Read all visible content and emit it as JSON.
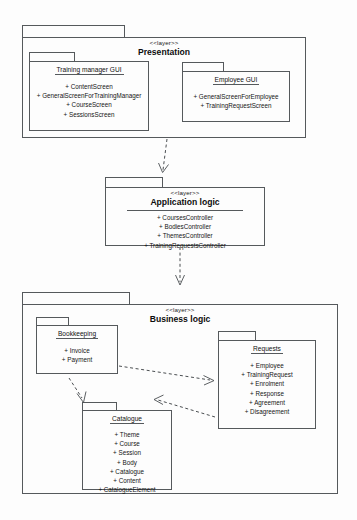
{
  "diagram": {
    "type": "uml-package-diagram",
    "stereotype": "<<layer>>",
    "visibility_marker": "+"
  },
  "layers": [
    {
      "id": "presentation",
      "stereotype": "<<layer>>",
      "name": "Presentation",
      "packages": [
        {
          "id": "training-manager-gui",
          "name": "Training manager GUI",
          "members": [
            "+ ContentScreen",
            "+ GeneralScreenForTrainingManager",
            "+ CourseScreen",
            "+ SessionsScreen"
          ]
        },
        {
          "id": "employee-gui",
          "name": "Employee GUI",
          "members": [
            "+ GeneralScreenForEmployee",
            "+ TrainingRequestScreen"
          ]
        }
      ]
    },
    {
      "id": "application-logic",
      "stereotype": "<<layer>>",
      "name": "Application logic",
      "members": [
        "+ CoursesController",
        "+ BodiesController",
        "+ ThemesController",
        "+ TrainingRequestsController"
      ],
      "packages": []
    },
    {
      "id": "business-logic",
      "stereotype": "<<layer>>",
      "name": "Business logic",
      "packages": [
        {
          "id": "bookkeeping",
          "name": "Bookkeeping",
          "members": [
            "+ Invoice",
            "+ Payment"
          ]
        },
        {
          "id": "requests",
          "name": "Requests",
          "members": [
            "+ Employee",
            "+ TrainingRequest",
            "+ Enrolment",
            "+ Response",
            "+ Agreement",
            "+ Disagreement"
          ]
        },
        {
          "id": "catalogue",
          "name": "Catalogue",
          "members": [
            "+ Theme",
            "+ Course",
            "+ Session",
            "+ Body",
            "+ Catalogue",
            "+ Content",
            "+ CatalogueElement"
          ]
        }
      ]
    }
  ],
  "dependencies": [
    {
      "id": "dep-presentation-application",
      "from": "presentation",
      "to": "application-logic",
      "style": "dashed-open-arrow"
    },
    {
      "id": "dep-application-business",
      "from": "application-logic",
      "to": "business-logic",
      "style": "dashed-open-arrow"
    },
    {
      "id": "dep-bookkeeping-requests",
      "from": "bookkeeping",
      "to": "requests",
      "style": "dashed-open-arrow"
    },
    {
      "id": "dep-bookkeeping-catalogue",
      "from": "bookkeeping",
      "to": "catalogue",
      "style": "dashed-open-arrow"
    },
    {
      "id": "dep-requests-catalogue",
      "from": "requests",
      "to": "catalogue",
      "style": "dashed-open-arrow"
    }
  ],
  "colors": {
    "stroke": "#55595c",
    "background": "#fdfdfd",
    "text": "#111111"
  }
}
